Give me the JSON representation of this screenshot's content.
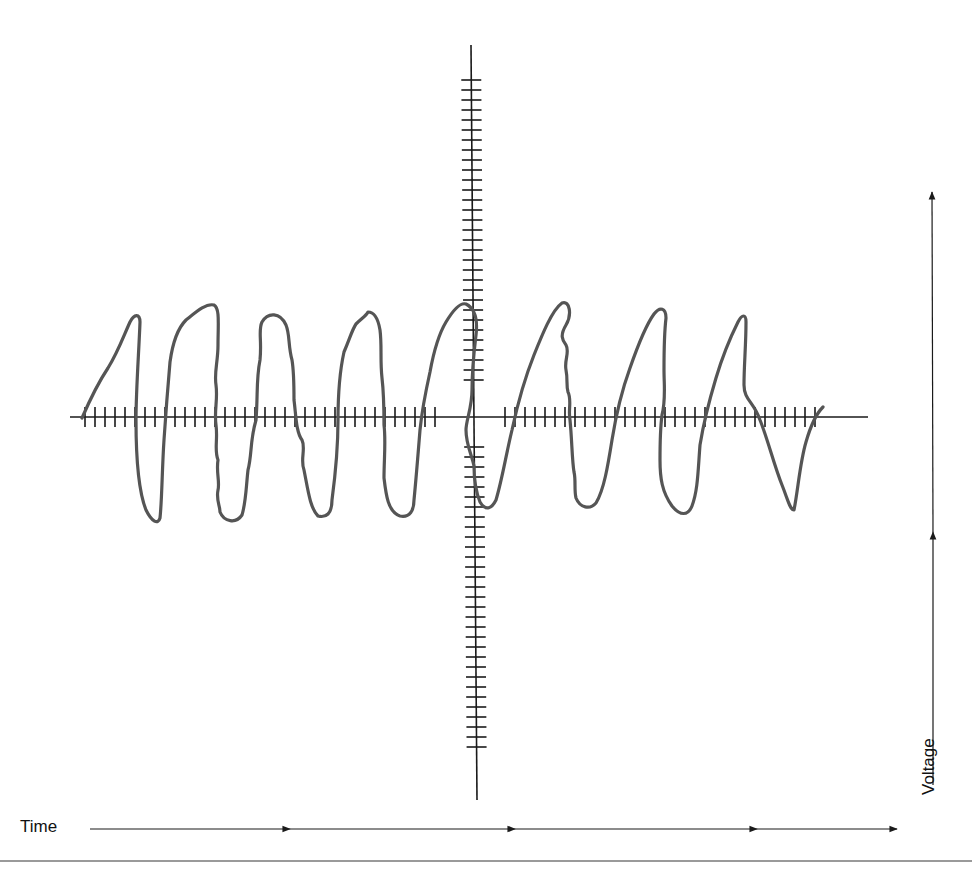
{
  "diagram": {
    "type": "oscilloscope-trace",
    "labels": {
      "time": "Time",
      "voltage": "Voltage"
    },
    "colors": {
      "axis": "#1a1a1a",
      "trace": "#555555",
      "divider": "#9a9a9a",
      "background": "#ffffff"
    },
    "axes": {
      "horizontal": {
        "y": 417,
        "x_start": 70,
        "x_end": 868,
        "tick_spacing": 10,
        "tick_ranges": [
          [
            85,
            443
          ],
          [
            505,
            822
          ]
        ],
        "tick_half": 10
      },
      "vertical": {
        "x_top": 471,
        "y_top": 45,
        "x_bottom": 477,
        "y_bottom": 800,
        "tick_spacing": 10,
        "tick_ranges": [
          [
            80,
            389
          ],
          [
            447,
            752
          ]
        ],
        "tick_half": 10
      }
    },
    "time_arrow": {
      "y": 829,
      "x_start": 90,
      "x_end": 897,
      "arrowheads_x": [
        290,
        515,
        757,
        897
      ]
    },
    "voltage_arrow": {
      "x": 932,
      "y_start": 785,
      "y_end": 192,
      "arrowheads_y": [
        532,
        192
      ]
    },
    "waveform": {
      "cycles": 8,
      "peaks_y_approx": [
        317,
        305,
        312,
        310,
        304,
        303,
        310,
        313
      ],
      "troughs_y_approx": [
        523,
        522,
        515,
        517,
        508,
        506,
        515,
        513
      ]
    }
  }
}
